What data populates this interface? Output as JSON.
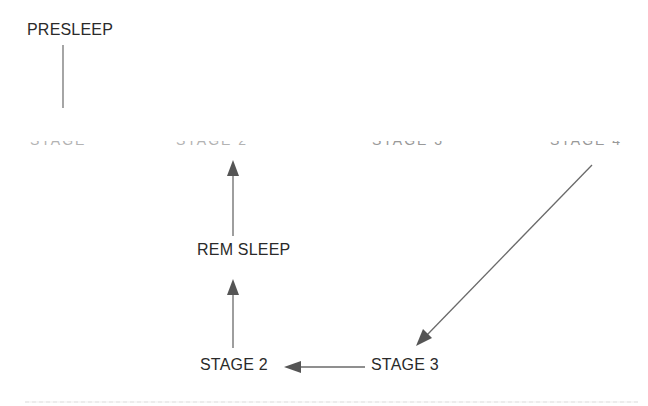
{
  "diagram": {
    "type": "sleep-cycle-flow",
    "nodes": {
      "presleep": "PRESLEEP",
      "rem_sleep": "REM SLEEP",
      "stage_2": "STAGE 2",
      "stage_3": "STAGE 3"
    },
    "cut_off_row": {
      "left_fragment": "STAGE 1",
      "middle_fragment": "STAGE 2",
      "right_a_fragment": "STAGE 3",
      "right_b_fragment": "STAGE 4"
    },
    "edges": [
      {
        "from": "PRESLEEP",
        "to": "(cut-off row)",
        "style": "line"
      },
      {
        "from": "STAGE 4 (cut-off)",
        "to": "STAGE 3",
        "style": "arrow"
      },
      {
        "from": "STAGE 3",
        "to": "STAGE 2",
        "style": "arrow"
      },
      {
        "from": "STAGE 2",
        "to": "REM SLEEP",
        "style": "arrow"
      },
      {
        "from": "REM SLEEP",
        "to": "(cut-off row)",
        "style": "arrow"
      }
    ],
    "colors": {
      "text": "#2a2a2a",
      "line": "#6a6a6a",
      "arrowhead": "#555555"
    }
  }
}
